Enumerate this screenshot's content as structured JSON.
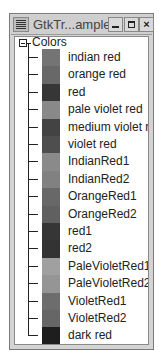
{
  "window": {
    "title": "GtkTr...ample",
    "buttons": {
      "minimize": "_",
      "maximize": "□",
      "close": "×"
    }
  },
  "tree": {
    "root": {
      "label": "Colors",
      "expanded": true
    },
    "items": [
      {
        "label": "indian red",
        "color": "#cd5c5c"
      },
      {
        "label": "orange red",
        "color": "#ff4500"
      },
      {
        "label": "red",
        "color": "#ff0000"
      },
      {
        "label": "pale violet red",
        "color": "#db7093"
      },
      {
        "label": "medium violet red",
        "color": "#c71585"
      },
      {
        "label": "violet red",
        "color": "#d02090"
      },
      {
        "label": "IndianRed1",
        "color": "#ff6a6a"
      },
      {
        "label": "IndianRed2",
        "color": "#ee6363"
      },
      {
        "label": "OrangeRed1",
        "color": "#ff4500"
      },
      {
        "label": "OrangeRed2",
        "color": "#ee4000"
      },
      {
        "label": "red1",
        "color": "#ff0000"
      },
      {
        "label": "red2",
        "color": "#ee0000"
      },
      {
        "label": "PaleVioletRed1",
        "color": "#ff82ab"
      },
      {
        "label": "PaleVioletRed2",
        "color": "#ee799f"
      },
      {
        "label": "VioletRed1",
        "color": "#ff3e96"
      },
      {
        "label": "VioletRed2",
        "color": "#ee3a8c"
      },
      {
        "label": "dark red",
        "color": "#8b0000"
      }
    ]
  }
}
